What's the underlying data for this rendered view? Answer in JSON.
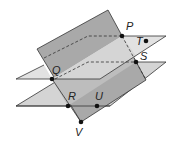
{
  "diagram": {
    "colors": {
      "vertical_plane": "#a6a6a6",
      "vertical_plane_light": "#c4c4c4",
      "horizontal_plane": "#dcdcdc",
      "edge": "#333333",
      "point": "#111111"
    },
    "points": [
      {
        "label": "P",
        "x": 122,
        "y": 36
      },
      {
        "label": "Q",
        "x": 52,
        "y": 79
      },
      {
        "label": "R",
        "x": 68,
        "y": 106
      },
      {
        "label": "S",
        "x": 136,
        "y": 62
      },
      {
        "label": "T",
        "x": 146,
        "y": 41
      },
      {
        "label": "U",
        "x": 97,
        "y": 106
      },
      {
        "label": "V",
        "x": 81,
        "y": 122
      }
    ],
    "labels": {
      "P": "P",
      "Q": "Q",
      "R": "R",
      "S": "S",
      "T": "T",
      "U": "U",
      "V": "V"
    }
  }
}
